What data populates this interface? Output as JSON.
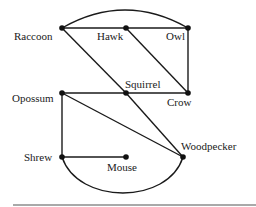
{
  "diagram": {
    "type": "graph",
    "colors": {
      "line": "#1a1a1a",
      "node": "#111111",
      "background": "#ffffff",
      "rule": "#555555"
    },
    "nodes": [
      {
        "id": "raccoon",
        "label": "Raccoon",
        "x": 62,
        "y": 28
      },
      {
        "id": "hawk",
        "label": "Hawk",
        "x": 126,
        "y": 28
      },
      {
        "id": "owl",
        "label": "Owl",
        "x": 188,
        "y": 28
      },
      {
        "id": "opossum",
        "label": "Opossum",
        "x": 62,
        "y": 93
      },
      {
        "id": "squirrel",
        "label": "Squirrel",
        "x": 126,
        "y": 93
      },
      {
        "id": "crow",
        "label": "Crow",
        "x": 188,
        "y": 93
      },
      {
        "id": "shrew",
        "label": "Shrew",
        "x": 62,
        "y": 157
      },
      {
        "id": "mouse",
        "label": "Mouse",
        "x": 126,
        "y": 157
      },
      {
        "id": "woodpecker",
        "label": "Woodpecker",
        "x": 183,
        "y": 157
      }
    ],
    "edges": [
      {
        "from": "raccoon",
        "to": "hawk",
        "shape": "line"
      },
      {
        "from": "hawk",
        "to": "owl",
        "shape": "line"
      },
      {
        "from": "raccoon",
        "to": "owl",
        "shape": "arc"
      },
      {
        "from": "owl",
        "to": "crow",
        "shape": "line"
      },
      {
        "from": "hawk",
        "to": "crow",
        "shape": "line"
      },
      {
        "from": "raccoon",
        "to": "squirrel",
        "shape": "line"
      },
      {
        "from": "squirrel",
        "to": "woodpecker",
        "shape": "line"
      },
      {
        "from": "opossum",
        "to": "squirrel",
        "shape": "line"
      },
      {
        "from": "squirrel",
        "to": "crow",
        "shape": "line"
      },
      {
        "from": "opossum",
        "to": "woodpecker",
        "shape": "line"
      },
      {
        "from": "opossum",
        "to": "shrew",
        "shape": "line"
      },
      {
        "from": "shrew",
        "to": "mouse",
        "shape": "line"
      },
      {
        "from": "shrew",
        "to": "woodpecker",
        "shape": "arc"
      }
    ]
  }
}
